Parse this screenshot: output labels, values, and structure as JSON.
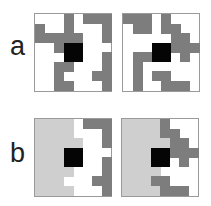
{
  "figure": {
    "rows": [
      {
        "label": "a",
        "panels": [
          {
            "name": "a-left",
            "grid": [
              [
                0,
                0,
                0,
                1,
                0,
                1,
                1,
                1
              ],
              [
                1,
                0,
                0,
                1,
                0,
                0,
                0,
                1
              ],
              [
                1,
                1,
                1,
                1,
                1,
                0,
                0,
                1
              ],
              [
                0,
                0,
                1,
                3,
                3,
                0,
                0,
                0
              ],
              [
                0,
                0,
                0,
                3,
                3,
                0,
                0,
                1
              ],
              [
                0,
                0,
                1,
                1,
                0,
                0,
                0,
                1
              ],
              [
                0,
                0,
                1,
                0,
                0,
                0,
                1,
                1
              ],
              [
                0,
                0,
                1,
                1,
                0,
                0,
                0,
                1
              ]
            ]
          },
          {
            "name": "a-right",
            "grid": [
              [
                1,
                1,
                1,
                0,
                1,
                0,
                0,
                0
              ],
              [
                0,
                1,
                1,
                0,
                1,
                1,
                0,
                0
              ],
              [
                0,
                0,
                0,
                0,
                0,
                1,
                1,
                0
              ],
              [
                0,
                0,
                0,
                3,
                3,
                1,
                1,
                1
              ],
              [
                0,
                1,
                1,
                3,
                3,
                0,
                1,
                0
              ],
              [
                0,
                1,
                0,
                0,
                0,
                0,
                0,
                0
              ],
              [
                0,
                1,
                0,
                1,
                1,
                0,
                0,
                0
              ],
              [
                0,
                1,
                0,
                0,
                1,
                1,
                1,
                0
              ]
            ]
          }
        ]
      },
      {
        "label": "b",
        "panels": [
          {
            "name": "b-left",
            "grid": [
              [
                2,
                2,
                2,
                2,
                0,
                1,
                1,
                1
              ],
              [
                2,
                2,
                2,
                2,
                0,
                0,
                0,
                1
              ],
              [
                2,
                2,
                2,
                2,
                2,
                0,
                0,
                1
              ],
              [
                2,
                2,
                2,
                3,
                3,
                0,
                0,
                0
              ],
              [
                2,
                2,
                2,
                3,
                3,
                0,
                0,
                1
              ],
              [
                2,
                2,
                2,
                2,
                0,
                0,
                0,
                1
              ],
              [
                2,
                2,
                2,
                0,
                0,
                0,
                1,
                1
              ],
              [
                2,
                2,
                2,
                2,
                0,
                0,
                0,
                1
              ]
            ]
          },
          {
            "name": "b-right",
            "grid": [
              [
                2,
                2,
                2,
                2,
                1,
                0,
                0,
                0
              ],
              [
                2,
                2,
                2,
                2,
                1,
                1,
                0,
                0
              ],
              [
                2,
                2,
                2,
                2,
                2,
                1,
                1,
                0
              ],
              [
                2,
                2,
                2,
                3,
                3,
                1,
                1,
                1
              ],
              [
                2,
                2,
                2,
                3,
                3,
                0,
                1,
                0
              ],
              [
                2,
                2,
                2,
                2,
                0,
                0,
                0,
                0
              ],
              [
                2,
                2,
                2,
                1,
                1,
                0,
                0,
                0
              ],
              [
                2,
                2,
                2,
                2,
                1,
                1,
                1,
                0
              ]
            ]
          }
        ]
      }
    ],
    "legend_colors": {
      "empty": "#ffffff",
      "dark": "#7d7d7d",
      "light": "#cfcfcf",
      "center": "#050505"
    }
  }
}
